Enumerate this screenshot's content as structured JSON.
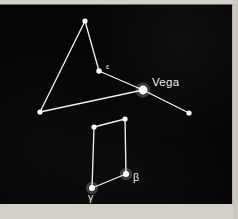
{
  "figure": {
    "kind": "star-chart",
    "constellation": "Lyra",
    "background_color": "#050505",
    "star_color": "#ffffff",
    "line_color": "#f2efe9",
    "mount_color": "#cfcbc4"
  },
  "chart_data": {
    "type": "scatter",
    "title": "",
    "xlabel": "",
    "ylabel": "",
    "xlim": [
      0,
      233
    ],
    "ylim": [
      0,
      200
    ],
    "grid": false,
    "legend": "none",
    "stars": [
      {
        "id": "apex",
        "label": "",
        "x": 85,
        "y": 16,
        "r": 2.6,
        "magnitude_rank": 3
      },
      {
        "id": "epsilon",
        "label": "ε",
        "x": 99,
        "y": 66,
        "r": 2.7,
        "magnitude_rank": 3,
        "label_x": 106,
        "label_y": 64,
        "label_size": "small"
      },
      {
        "id": "vega",
        "label": "Vega",
        "x": 143,
        "y": 85,
        "r": 4.4,
        "magnitude_rank": 1,
        "label_x": 152,
        "label_y": 81,
        "label_size": "large"
      },
      {
        "id": "west",
        "label": "",
        "x": 40,
        "y": 107,
        "r": 2.6,
        "magnitude_rank": 4
      },
      {
        "id": "east",
        "label": "",
        "x": 189,
        "y": 108,
        "r": 2.6,
        "magnitude_rank": 4
      },
      {
        "id": "zeta",
        "label": "",
        "x": 94,
        "y": 122,
        "r": 2.6,
        "magnitude_rank": 3
      },
      {
        "id": "delta",
        "label": "",
        "x": 125,
        "y": 114,
        "r": 2.6,
        "magnitude_rank": 3
      },
      {
        "id": "beta",
        "label": "β",
        "x": 126,
        "y": 169,
        "r": 3.0,
        "magnitude_rank": 2,
        "label_x": 133,
        "label_y": 176,
        "label_size": "medium"
      },
      {
        "id": "gamma",
        "label": "γ",
        "x": 92,
        "y": 183,
        "r": 3.0,
        "magnitude_rank": 2,
        "label_x": 88,
        "label_y": 196,
        "label_size": "medium"
      }
    ],
    "lines": [
      {
        "from": "apex",
        "to": "west"
      },
      {
        "from": "apex",
        "to": "epsilon"
      },
      {
        "from": "epsilon",
        "to": "vega"
      },
      {
        "from": "west",
        "to": "vega"
      },
      {
        "from": "vega",
        "to": "east"
      },
      {
        "from": "zeta",
        "to": "delta"
      },
      {
        "from": "delta",
        "to": "beta"
      },
      {
        "from": "beta",
        "to": "gamma"
      },
      {
        "from": "gamma",
        "to": "zeta"
      }
    ]
  }
}
